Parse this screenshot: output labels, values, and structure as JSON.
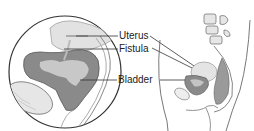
{
  "diagram": {
    "labels": [
      {
        "text": "Uterus"
      },
      {
        "text": "Fistula"
      },
      {
        "text": "Bladder"
      }
    ],
    "colors": {
      "organ_dark": "#8a8a8a",
      "organ_light": "#c4c4c4",
      "outline": "#444444",
      "bone": "#d8d8d8"
    }
  }
}
